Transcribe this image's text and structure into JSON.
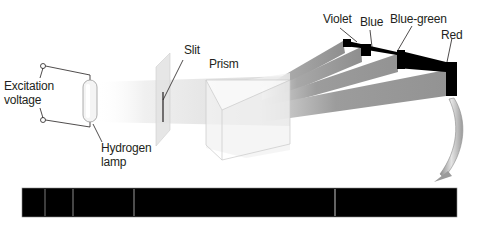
{
  "diagram": {
    "labels": {
      "excitation": "Excitation",
      "voltage": "voltage",
      "hydrogen": "Hydrogen",
      "lamp": "lamp",
      "slit": "Slit",
      "prism": "Prism",
      "violet": "Violet",
      "blue": "Blue",
      "blue_green": "Blue-green",
      "red": "Red"
    },
    "colors": {
      "line_stroke": "#231f20",
      "beam_light": "#e6e6e6",
      "beam_mid": "#a0a0a0",
      "beam_dark": "#8c8c8c",
      "spectrum_background": "#000000",
      "spectral_line": "#9a9a9a",
      "arrow_fill": "#b5b5b5"
    },
    "spectrum": {
      "x_start": 22,
      "x_end": 457,
      "lines_x": [
        45,
        73,
        134,
        335
      ]
    }
  }
}
